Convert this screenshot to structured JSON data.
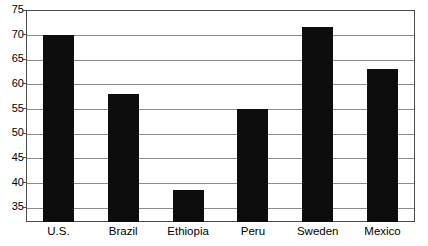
{
  "chart_data": {
    "type": "bar",
    "title": "",
    "subtitle": "",
    "xlabel": "",
    "ylabel": "",
    "categories": [
      "U.S.",
      "Brazil",
      "Ethiopia",
      "Peru",
      "Sweden",
      "Mexico"
    ],
    "values": [
      70,
      58,
      38.5,
      55,
      71.5,
      63
    ],
    "ylim": [
      32,
      75
    ],
    "yticks": [
      35,
      40,
      45,
      50,
      55,
      60,
      65,
      70,
      75
    ],
    "ytick_labels": [
      "35",
      "40",
      "45",
      "50",
      "55",
      "60",
      "65",
      "70",
      "75"
    ],
    "grid": true,
    "grid_axis": "y",
    "legend": false,
    "legend_position": "none",
    "bar_color": "#0d0d0d",
    "grid_color": "#8c8c8c",
    "frame_color": "#4a4a4a",
    "background_color": "#ffffff"
  }
}
